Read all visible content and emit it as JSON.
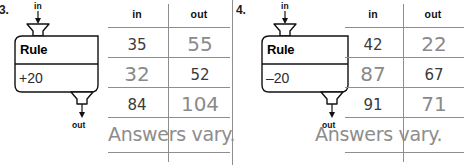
{
  "worksheet": {
    "background_color": "#ffffff",
    "rule_text_color": "#000000",
    "printed_answer_color": "#3a3a3a",
    "filled_answer_color": "#8a8a8a",
    "line_color": "#8e8e8e"
  },
  "problems": [
    {
      "number": "3.",
      "machine": {
        "input_label": "in",
        "output_label": "out",
        "rule_title": "Rule",
        "rule_expression": "+20"
      },
      "table": {
        "headers": [
          "in",
          "out"
        ],
        "rows": [
          {
            "in": "35",
            "in_style": "printed",
            "out": "55",
            "out_style": "filled"
          },
          {
            "in": "32",
            "in_style": "filled",
            "out": "52",
            "out_style": "printed"
          },
          {
            "in": "84",
            "in_style": "printed",
            "out": "104",
            "out_style": "filled"
          }
        ]
      },
      "note": "Answers vary."
    },
    {
      "number": "4.",
      "machine": {
        "input_label": "in",
        "output_label": "out",
        "rule_title": "Rule",
        "rule_expression": "–20"
      },
      "table": {
        "headers": [
          "in",
          "out"
        ],
        "rows": [
          {
            "in": "42",
            "in_style": "printed",
            "out": "22",
            "out_style": "filled"
          },
          {
            "in": "87",
            "in_style": "filled",
            "out": "67",
            "out_style": "printed"
          },
          {
            "in": "91",
            "in_style": "printed",
            "out": "71",
            "out_style": "filled"
          }
        ]
      },
      "note": "Answers vary."
    }
  ]
}
